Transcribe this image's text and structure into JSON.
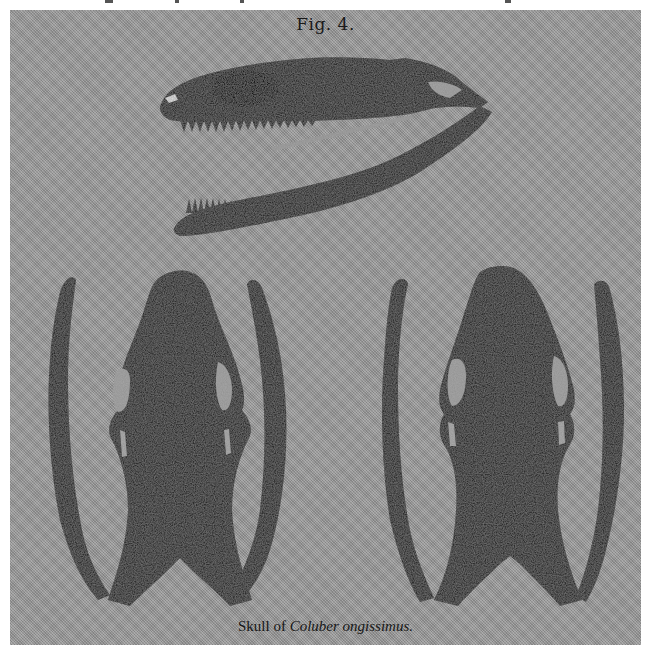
{
  "figure": {
    "label": "Fig. 4.",
    "caption_prefix": "Skull of ",
    "caption_genus": "Coluber",
    "caption_species": "ongissimus."
  },
  "views": [
    {
      "name": "lateral-view",
      "description": "Skull shown in side view with open jaws"
    },
    {
      "name": "dorsal-view",
      "description": "Skull shown from above with mandibles spread"
    },
    {
      "name": "ventral-view",
      "description": "Skull shown from below with mandibles spread"
    }
  ],
  "colors": {
    "plate": "#9c9c9c",
    "ink": "#2b2b2b",
    "page": "#ffffff"
  }
}
